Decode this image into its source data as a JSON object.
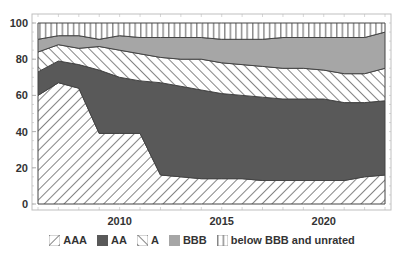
{
  "chart_data": {
    "type": "area",
    "stacked": true,
    "title": "",
    "xlabel": "",
    "ylabel": "",
    "x": [
      2006,
      2007,
      2008,
      2009,
      2010,
      2011,
      2012,
      2013,
      2014,
      2015,
      2016,
      2017,
      2018,
      2019,
      2020,
      2021,
      2022,
      2023
    ],
    "xticks": [
      "2010",
      "2015",
      "2020"
    ],
    "yticks": [
      "0",
      "20",
      "40",
      "60",
      "80",
      "100"
    ],
    "ylim": [
      0,
      100
    ],
    "grid": false,
    "legend_position": "bottom",
    "cumulative_tops": {
      "AAA": [
        60,
        67,
        64,
        39,
        39,
        39,
        16,
        15,
        14,
        14,
        14,
        13,
        13,
        13,
        13,
        13,
        15,
        16
      ],
      "AA": [
        73,
        79,
        77,
        74,
        70,
        68,
        67,
        65,
        63,
        61,
        60,
        59,
        58,
        58,
        58,
        56,
        56,
        57
      ],
      "A": [
        84,
        88,
        86,
        87,
        85,
        83,
        81,
        80,
        80,
        78,
        77,
        76,
        75,
        75,
        74,
        72,
        72,
        75
      ],
      "BBB": [
        91,
        93,
        93,
        91,
        93,
        92,
        92,
        92,
        92,
        91,
        91,
        91,
        92,
        92,
        92,
        92,
        92,
        95
      ],
      "below BBB and unrated": [
        100,
        100,
        100,
        100,
        100,
        100,
        100,
        100,
        100,
        100,
        100,
        100,
        100,
        100,
        100,
        100,
        100,
        100
      ]
    },
    "series": [
      {
        "name": "AAA",
        "pattern": "diagonal-back",
        "values": [
          60,
          67,
          64,
          39,
          39,
          39,
          16,
          15,
          14,
          14,
          14,
          13,
          13,
          13,
          13,
          13,
          15,
          16
        ]
      },
      {
        "name": "AA",
        "pattern": "solid-dark",
        "values": [
          13,
          12,
          13,
          35,
          31,
          29,
          51,
          50,
          49,
          47,
          46,
          46,
          45,
          45,
          45,
          43,
          41,
          41
        ]
      },
      {
        "name": "A",
        "pattern": "diagonal-forward",
        "values": [
          11,
          9,
          9,
          13,
          15,
          15,
          14,
          15,
          17,
          17,
          17,
          17,
          17,
          17,
          16,
          16,
          16,
          18
        ]
      },
      {
        "name": "BBB",
        "pattern": "solid-light",
        "values": [
          7,
          5,
          7,
          4,
          8,
          9,
          11,
          12,
          12,
          13,
          14,
          15,
          17,
          17,
          18,
          20,
          20,
          20
        ]
      },
      {
        "name": "below BBB and unrated",
        "pattern": "vertical-lines",
        "values": [
          9,
          7,
          7,
          9,
          7,
          8,
          8,
          8,
          8,
          9,
          9,
          9,
          8,
          8,
          8,
          8,
          8,
          5
        ]
      }
    ]
  },
  "legend": {
    "items": [
      {
        "label": "AAA"
      },
      {
        "label": "AA"
      },
      {
        "label": "A"
      },
      {
        "label": "BBB"
      },
      {
        "label": "below BBB and unrated"
      }
    ]
  },
  "colors": {
    "dark": "#595959",
    "light": "#a6a6a6",
    "hatch": "#666666",
    "frame": "#bfbfbf",
    "text": "#333333"
  }
}
